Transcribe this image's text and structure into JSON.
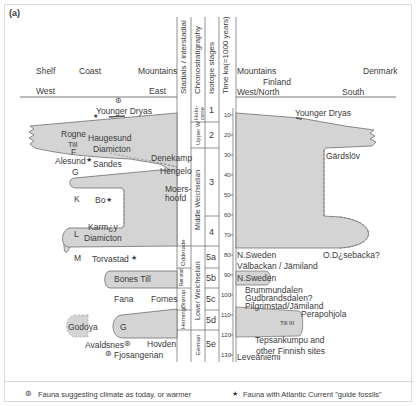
{
  "panel_label": "(a)",
  "left_header": {
    "shelf": "Shelf",
    "coast": "Coast",
    "mountains": "Mountains",
    "west": "West",
    "east": "East"
  },
  "right_header": {
    "mountains": "Mountains",
    "finland": "Finland",
    "denmark": "Denmark",
    "west_north": "West/North",
    "south": "South"
  },
  "column_headers": {
    "stadials": "Stadials / interstadial",
    "chronostratigraphy": "Chronostratigraphy",
    "isotope": "Isotope stages",
    "time": "Time ka(=1000 years)"
  },
  "chronostratigraphy": {
    "holocene": "Holo-cene",
    "upper_w": "Upper W",
    "middle": "Middle Weichselian",
    "lower": "Lower Weichselian",
    "eemian": "Eemian"
  },
  "stadials": {
    "odderade": "Odderade",
    "rorstad": "Rør-stad",
    "brorup": "Brørup",
    "herning": "Herning"
  },
  "isotope_stages": [
    "1",
    "2",
    "3",
    "4",
    "5a",
    "5b",
    "5c",
    "5d",
    "5e"
  ],
  "time_ticks": [
    "10",
    "20",
    "30",
    "40",
    "50",
    "60",
    "70",
    "80",
    "90",
    "100",
    "110",
    "120",
    "130"
  ],
  "left_labels": {
    "younger_dryas": "Younger Dryas",
    "rogne": "Rogne",
    "till": "Till",
    "f": "F",
    "haugesund": "Haugesund",
    "diamicton1": "Diamicton",
    "alesund": "Alesund",
    "sandes": "Sandes",
    "g1": "G",
    "denekamp": "Denekamp",
    "hengelo": "Hengelo",
    "moershoofd": "Moers-\nhoofd",
    "k": "K",
    "bo": "Bo",
    "l": "L",
    "karmoy": "Karm¿y",
    "diamicton2": "Diamicton",
    "m": "M",
    "torvastad": "Torvastad",
    "bones_till": "Bones Till",
    "fana": "Fana",
    "fornes": "Fornes",
    "godoya": "Godoya",
    "g2": "G",
    "avaldsnes": "Avaldsnes",
    "hovden": "Hovden",
    "fjosangerian": "Fjosangerian"
  },
  "right_labels": {
    "younger_dryas": "Younger Dryas",
    "gardslov": "Gärdslöv",
    "n_sweden1": "N.Sweden",
    "odsebacka": "O.D¿sebacka?",
    "valbackan": "Välbackan / Jämiland",
    "n_sweden2": "N.Sweden",
    "brummundalen": "Brummundalen",
    "gudbrandsdalen": "Gudbrandsdalen?",
    "pilgrimstad": "Pilgrimstad/Jämiland",
    "perapohjola": "Perapohjola",
    "till_iii": "Till III",
    "tepsankumpu": "Tepsankumpu and",
    "finnish_sites": "other Finnish sites",
    "leveaniemi": "Leveäniemi"
  },
  "legend": {
    "item1": "Fauna suggesting climate as today, or warmer",
    "item2": "Fauna with Atlantic Current \"guide fossils\""
  },
  "colors": {
    "ice_fill": "#d4d4d4",
    "ice_edge": "#707070",
    "lines": "#555555"
  }
}
